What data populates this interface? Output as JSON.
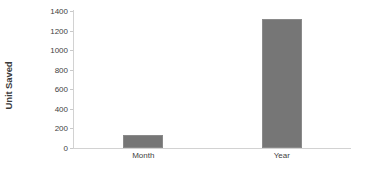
{
  "chart_data": {
    "type": "bar",
    "title": "",
    "xlabel": "",
    "ylabel": "Unit Saved",
    "categories": [
      "Month",
      "Year"
    ],
    "values": [
      135,
      1315
    ],
    "series": [
      {
        "name": "Unit Saved",
        "values": [
          135,
          1315
        ],
        "color": "#767676"
      }
    ],
    "ylim": [
      0,
      1400
    ],
    "yticks": [
      0,
      200,
      400,
      600,
      800,
      1000,
      1200,
      1400
    ],
    "ytick_labels": [
      "0",
      "200",
      "400",
      "600",
      "800",
      "1000",
      "1200",
      "1400"
    ],
    "grid": false,
    "legend": false,
    "legend_position": "none",
    "bar_color": "#767676",
    "axis_color": "#d2d2d2",
    "text_color": "#3f3f3f",
    "background": "#ffffff"
  }
}
